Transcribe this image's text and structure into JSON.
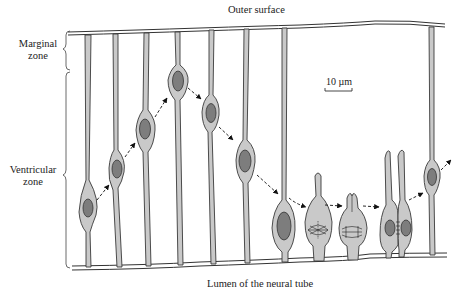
{
  "diagram": {
    "labels": {
      "outer_surface": "Outer surface",
      "lumen": "Lumen of the neural tube",
      "marginal_zone_line1": "Marginal",
      "marginal_zone_line2": "zone",
      "ventricular_zone_line1": "Ventricular",
      "ventricular_zone_line2": "zone",
      "scale_bar": "10 µm"
    },
    "colors": {
      "cell_fill": "#c9c9c9",
      "nucleus_fill": "#7d7d7d",
      "outline": "#333333",
      "background": "#ffffff"
    },
    "cells": [
      {
        "stage": "nucleus near lumen",
        "x": 88
      },
      {
        "stage": "nucleus migrating outward",
        "x": 118
      },
      {
        "stage": "nucleus migrating outward",
        "x": 145
      },
      {
        "stage": "nucleus near outer zone",
        "x": 178
      },
      {
        "stage": "nucleus migrating inward",
        "x": 210
      },
      {
        "stage": "nucleus migrating inward",
        "x": 245
      },
      {
        "stage": "nucleus at lumen",
        "x": 283
      },
      {
        "stage": "mitosis - metaphase",
        "x": 318
      },
      {
        "stage": "mitosis - anaphase",
        "x": 352
      },
      {
        "stage": "cytokinesis - daughter cells",
        "x": 396
      },
      {
        "stage": "daughter nucleus migrating outward",
        "x": 432
      }
    ]
  }
}
